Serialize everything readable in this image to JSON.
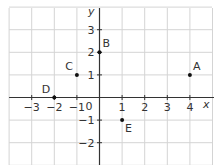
{
  "chart_data": {
    "type": "scatter",
    "title": "",
    "xlabel": "x",
    "ylabel": "y",
    "xlim": [
      -4,
      5
    ],
    "ylim": [
      -3,
      4
    ],
    "grid": true,
    "origin_label": "0",
    "x_ticks": [
      {
        "value": -3,
        "label": "−3"
      },
      {
        "value": -2,
        "label": "−2"
      },
      {
        "value": -1,
        "label": "−1"
      },
      {
        "value": 1,
        "label": "1"
      },
      {
        "value": 2,
        "label": "2"
      },
      {
        "value": 3,
        "label": "3"
      },
      {
        "value": 4,
        "label": "4"
      }
    ],
    "y_ticks": [
      {
        "value": 3,
        "label": "3"
      },
      {
        "value": 2,
        "label": "2"
      },
      {
        "value": 1,
        "label": "1"
      },
      {
        "value": -1,
        "label": "−1"
      },
      {
        "value": -2,
        "label": "−2"
      }
    ],
    "points": [
      {
        "name": "A",
        "x": 4,
        "y": 1,
        "label_pos": "above-right"
      },
      {
        "name": "B",
        "x": 0,
        "y": 2,
        "label_pos": "above-right"
      },
      {
        "name": "C",
        "x": -1,
        "y": 1,
        "label_pos": "above-left"
      },
      {
        "name": "D",
        "x": -2,
        "y": 0,
        "label_pos": "above-left"
      },
      {
        "name": "E",
        "x": 1,
        "y": -1,
        "label_pos": "below-right"
      }
    ]
  }
}
